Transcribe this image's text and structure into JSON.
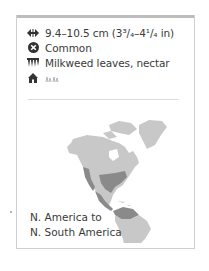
{
  "facts": {
    "size": {
      "icon": "wingspan-arrows-icon",
      "text": "9.4–10.5 cm (3³/₄–4¹/₄ in)"
    },
    "status": {
      "icon": "status-cross-circle-icon",
      "text": "Common"
    },
    "food": {
      "icon": "foodplant-icon",
      "text": "Milkweed leaves, nectar"
    },
    "habitat": {
      "icon": "home-icon",
      "symbol": "grassland-habitat-icon"
    }
  },
  "map": {
    "region": "Americas",
    "land_color": "#c8c8c8",
    "range_color": "#8a8a8a"
  },
  "range": {
    "line1": "N. America to",
    "line2": "N. South America"
  },
  "colors": {
    "text": "#3a3a3a",
    "border": "#cfcfcf",
    "top_strip": "#bdbdbd"
  }
}
